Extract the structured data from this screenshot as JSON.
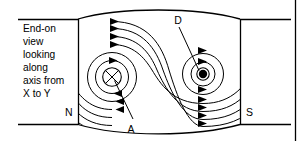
{
  "figure": {
    "caption_lines": [
      "End-on",
      "view",
      "looking",
      "along",
      "axis from",
      "X to Y"
    ],
    "labels": {
      "pole_north": "N",
      "pole_south": "S",
      "point_a": "A",
      "point_d": "D"
    },
    "conductors": [
      {
        "id": "left-conductor",
        "marker": "cross",
        "marker_meaning": "current into page",
        "cx": 112,
        "cy": 77,
        "r": 9.5
      },
      {
        "id": "right-conductor",
        "marker": "dot",
        "marker_meaning": "current out of page",
        "cx": 203,
        "cy": 74,
        "r": 4.6
      }
    ],
    "field_line_count": 5,
    "arrow_direction": "right",
    "colors": {
      "stroke": "#000000",
      "background": "#ffffff",
      "fill": "#ffffff"
    }
  }
}
